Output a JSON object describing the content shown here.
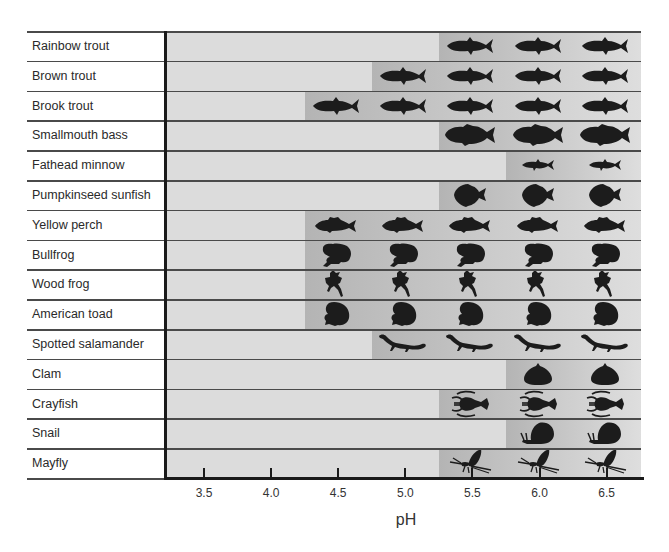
{
  "chart_data": {
    "type": "table",
    "title": "",
    "xlabel": "pH",
    "ylabel": "",
    "x_ticks": [
      "3.5",
      "4.0",
      "4.5",
      "5.0",
      "5.5",
      "6.0",
      "6.5"
    ],
    "xlim": [
      3.25,
      6.75
    ],
    "grid": "horizontal row dividers",
    "legend": "none",
    "rows": [
      {
        "label": "Rainbow trout",
        "icon": "trout-icon",
        "min_ph": 5.5,
        "present_at": [
          "5.5",
          "6.0",
          "6.5"
        ]
      },
      {
        "label": "Brown trout",
        "icon": "trout-icon",
        "min_ph": 5.0,
        "present_at": [
          "5.0",
          "5.5",
          "6.0",
          "6.5"
        ]
      },
      {
        "label": "Brook trout",
        "icon": "trout-icon",
        "min_ph": 4.5,
        "present_at": [
          "4.5",
          "5.0",
          "5.5",
          "6.0",
          "6.5"
        ]
      },
      {
        "label": "Smallmouth bass",
        "icon": "bass-icon",
        "min_ph": 5.5,
        "present_at": [
          "5.5",
          "6.0",
          "6.5"
        ]
      },
      {
        "label": "Fathead minnow",
        "icon": "minnow-icon",
        "min_ph": 6.0,
        "present_at": [
          "6.0",
          "6.5"
        ]
      },
      {
        "label": "Pumpkinseed sunfish",
        "icon": "sunfish-icon",
        "min_ph": 5.5,
        "present_at": [
          "5.5",
          "6.0",
          "6.5"
        ]
      },
      {
        "label": "Yellow perch",
        "icon": "perch-icon",
        "min_ph": 4.5,
        "present_at": [
          "4.5",
          "5.0",
          "5.5",
          "6.0",
          "6.5"
        ]
      },
      {
        "label": "Bullfrog",
        "icon": "bullfrog-icon",
        "min_ph": 4.5,
        "present_at": [
          "4.5",
          "5.0",
          "5.5",
          "6.0",
          "6.5"
        ]
      },
      {
        "label": "Wood frog",
        "icon": "wood-frog-icon",
        "min_ph": 4.5,
        "present_at": [
          "4.5",
          "5.0",
          "5.5",
          "6.0",
          "6.5"
        ]
      },
      {
        "label": "American toad",
        "icon": "toad-icon",
        "min_ph": 4.5,
        "present_at": [
          "4.5",
          "5.0",
          "5.5",
          "6.0",
          "6.5"
        ]
      },
      {
        "label": "Spotted salamander",
        "icon": "salamander-icon",
        "min_ph": 5.0,
        "present_at": [
          "5.0",
          "5.5",
          "6.0",
          "6.5"
        ]
      },
      {
        "label": "Clam",
        "icon": "clam-icon",
        "min_ph": 6.0,
        "present_at": [
          "6.0",
          "6.5"
        ]
      },
      {
        "label": "Crayfish",
        "icon": "crayfish-icon",
        "min_ph": 5.5,
        "present_at": [
          "5.5",
          "6.0",
          "6.5"
        ]
      },
      {
        "label": "Snail",
        "icon": "snail-icon",
        "min_ph": 6.0,
        "present_at": [
          "6.0",
          "6.5"
        ]
      },
      {
        "label": "Mayfly",
        "icon": "mayfly-icon",
        "min_ph": 5.5,
        "present_at": [
          "5.5",
          "6.0",
          "6.5"
        ]
      }
    ]
  },
  "colors": {
    "plot_background": "#dcdcdc",
    "shade_start": "#b4b4b4",
    "shade_end": "#dedede",
    "icon_fill": "#1c1c1c",
    "axis": "#1a1a1a",
    "divider": "#4a4a4a"
  }
}
